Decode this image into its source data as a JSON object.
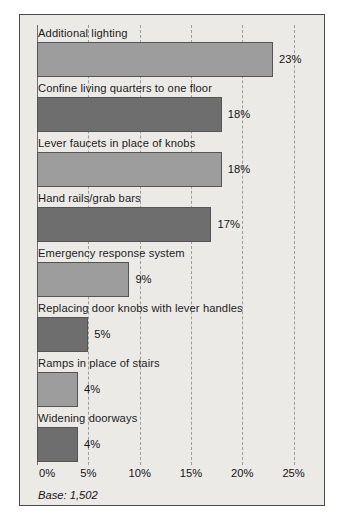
{
  "chart_data": {
    "type": "bar",
    "orientation": "horizontal",
    "title": "",
    "xlabel": "",
    "ylabel": "",
    "xlim": [
      0,
      26.5
    ],
    "grid": true,
    "gridline_style": "dashed",
    "legend": false,
    "categories": [
      "Additional lighting",
      "Confine living quarters to one floor",
      "Lever faucets in place of knobs",
      "Hand rails/grab bars",
      "Emergency response system",
      "Replacing door knobs with lever handles",
      "Ramps in place of stairs",
      "Widening doorways"
    ],
    "values": [
      23,
      18,
      18,
      17,
      9,
      5,
      4,
      4
    ],
    "value_labels": [
      "23%",
      "18%",
      "18%",
      "17%",
      "9%",
      "5%",
      "4%",
      "4%"
    ],
    "bar_shades": [
      "light",
      "dark",
      "light",
      "dark",
      "light",
      "dark",
      "light",
      "dark"
    ],
    "xticks": [
      0,
      5,
      10,
      15,
      20,
      25
    ],
    "xtick_labels": [
      "0%",
      "5%",
      "10%",
      "15%",
      "20%",
      "25%"
    ],
    "footnote": "Base: 1,502",
    "colors": {
      "background": "#eceae7",
      "border": "#4b4b4b",
      "bar_light": "#9d9d9d",
      "bar_dark": "#6e6e6e",
      "bar_outline": "#555555",
      "gridline": "#9b9b9b",
      "text": "#141414"
    }
  }
}
